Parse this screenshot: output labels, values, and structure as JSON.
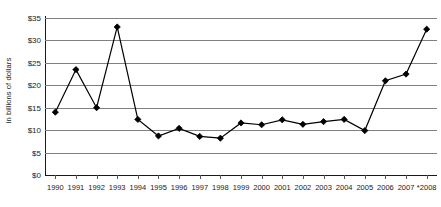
{
  "chart_data": {
    "type": "line",
    "title": "",
    "subtitle": "",
    "xlabel": "",
    "ylabel": "in billions of dollars",
    "categories": [
      "1990",
      "1991",
      "1992",
      "1993",
      "1994",
      "1995",
      "1996",
      "1997",
      "1998",
      "1999",
      "2000",
      "2001",
      "2002",
      "2003",
      "2004",
      "2005",
      "2006",
      "2007",
      "*2008"
    ],
    "values": [
      14.0,
      23.5,
      15.0,
      33.0,
      12.4,
      8.7,
      10.4,
      8.6,
      8.2,
      11.6,
      11.2,
      12.3,
      11.3,
      11.9,
      12.4,
      9.9,
      21.0,
      22.5,
      32.5
    ],
    "series": [
      {
        "name": "in billions of dollars",
        "values": [
          14.0,
          23.5,
          15.0,
          33.0,
          12.4,
          8.7,
          10.4,
          8.6,
          8.2,
          11.6,
          11.2,
          12.3,
          11.3,
          11.9,
          12.4,
          9.9,
          21.0,
          22.5,
          32.5
        ]
      }
    ],
    "ylim": [
      0,
      35
    ],
    "ytick_values": [
      0,
      5,
      10,
      15,
      20,
      25,
      30,
      35
    ],
    "ytick_labels": [
      "$0",
      "$5",
      "$10",
      "$15",
      "$20",
      "$25",
      "$30",
      "$35"
    ],
    "grid": true,
    "grid_axis": "y",
    "legend": false,
    "legend_position": "none",
    "marker": "diamond",
    "line_color": "#000000",
    "marker_color": "#000000",
    "grid_color": "#808080",
    "axis_color": "#1a1a1a",
    "background_color": "#ffffff"
  }
}
